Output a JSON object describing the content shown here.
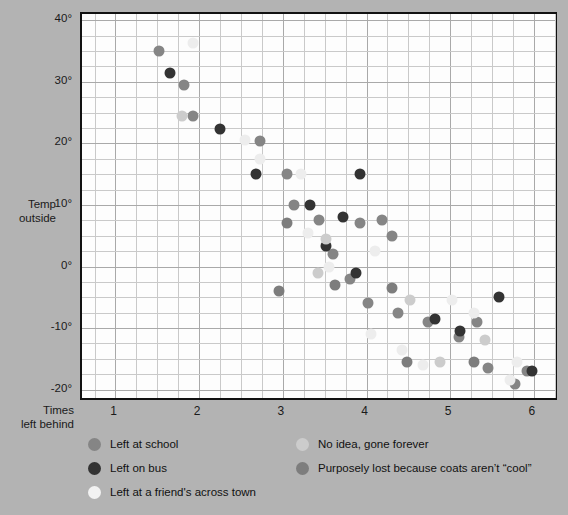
{
  "chart_data": {
    "type": "scatter",
    "title": "",
    "xlabel": "Times left behind",
    "ylabel": "Temp outside",
    "xlim": [
      0.6,
      6.3
    ],
    "ylim": [
      -22,
      41
    ],
    "grid": true,
    "x_ticks": [
      1,
      2,
      3,
      4,
      5,
      6
    ],
    "x_tick_labels": [
      "1",
      "2",
      "3",
      "4",
      "5",
      "6"
    ],
    "y_ticks": [
      40,
      30,
      20,
      10,
      0,
      -10,
      -20
    ],
    "y_tick_labels": [
      "40°",
      "30°",
      "20°",
      "10°",
      "0°",
      "-10°",
      "-20°"
    ],
    "legend_position": "below-plot",
    "series": [
      {
        "name": "Left at school",
        "color": "#858585",
        "points": [
          [
            1.52,
            35.0
          ],
          [
            1.82,
            29.5
          ],
          [
            1.93,
            24.5
          ],
          [
            2.73,
            20.3
          ],
          [
            3.05,
            15.0
          ],
          [
            3.13,
            10.0
          ],
          [
            3.43,
            7.5
          ],
          [
            3.6,
            2.0
          ],
          [
            3.92,
            7.0
          ],
          [
            4.18,
            7.5
          ],
          [
            4.3,
            5.0
          ],
          [
            3.8,
            -2.0
          ],
          [
            4.02,
            -6.0
          ],
          [
            4.38,
            -7.5
          ],
          [
            4.74,
            -9.0
          ],
          [
            5.1,
            -11.5
          ],
          [
            5.32,
            -9.0
          ],
          [
            5.45,
            -16.5
          ],
          [
            5.78,
            -19.0
          ],
          [
            5.92,
            -17.0
          ]
        ]
      },
      {
        "name": "Left on bus",
        "color": "#333333",
        "points": [
          [
            1.65,
            31.5
          ],
          [
            2.25,
            22.3
          ],
          [
            2.68,
            15.0
          ],
          [
            3.92,
            15.0
          ],
          [
            3.33,
            10.0
          ],
          [
            3.72,
            8.0
          ],
          [
            3.52,
            3.3
          ],
          [
            3.88,
            -1.0
          ],
          [
            4.82,
            -8.5
          ],
          [
            5.12,
            -10.5
          ],
          [
            5.58,
            -5.0
          ],
          [
            5.98,
            -17.0
          ]
        ]
      },
      {
        "name": "Left at a friend's across town",
        "color": "#ededed",
        "points": [
          [
            1.93,
            36.3
          ],
          [
            2.55,
            20.5
          ],
          [
            2.73,
            17.5
          ],
          [
            3.22,
            15.0
          ],
          [
            3.3,
            5.5
          ],
          [
            3.55,
            0.0
          ],
          [
            4.1,
            2.5
          ],
          [
            4.05,
            -11.0
          ],
          [
            4.42,
            -13.5
          ],
          [
            4.68,
            -16.0
          ],
          [
            5.02,
            -5.5
          ],
          [
            5.28,
            -7.5
          ],
          [
            5.72,
            -18.5
          ],
          [
            5.8,
            -15.5
          ]
        ]
      },
      {
        "name": "No idea, gone forever",
        "color": "#cccccc",
        "points": [
          [
            1.8,
            24.5
          ],
          [
            3.52,
            4.5
          ],
          [
            3.42,
            -1.0
          ],
          [
            4.52,
            -5.5
          ],
          [
            5.42,
            -12.0
          ],
          [
            4.88,
            -15.5
          ]
        ]
      },
      {
        "name": "Purposely lost because coats aren't “cool”",
        "color": "#7d7d7d",
        "points": [
          [
            3.05,
            7.0
          ],
          [
            2.95,
            -4.0
          ],
          [
            3.62,
            -3.0
          ],
          [
            4.3,
            -3.5
          ],
          [
            4.48,
            -15.5
          ],
          [
            5.28,
            -15.5
          ]
        ]
      }
    ]
  },
  "axes": {
    "y_title": "Temp\noutside",
    "x_title": "Times\nleft behind"
  },
  "legend": {
    "columns": [
      {
        "items": [
          {
            "label": "Left at school",
            "color": "#858585"
          },
          {
            "label": "Left on bus",
            "color": "#333333"
          },
          {
            "label": "Left at a friend's across town",
            "color": "#f2f2f2"
          }
        ]
      },
      {
        "items": [
          {
            "label": "No idea, gone forever",
            "color": "#cccccc"
          },
          {
            "label": "Purposely lost because coats aren’t “cool”",
            "color": "#7d7d7d"
          }
        ]
      }
    ]
  },
  "colors": {
    "background": "#b3b3b3",
    "plot_background": "#fdfdfd",
    "grid_minor": "#c9c9c9",
    "grid_major": "#a9a9a9",
    "frame": "#111111"
  }
}
